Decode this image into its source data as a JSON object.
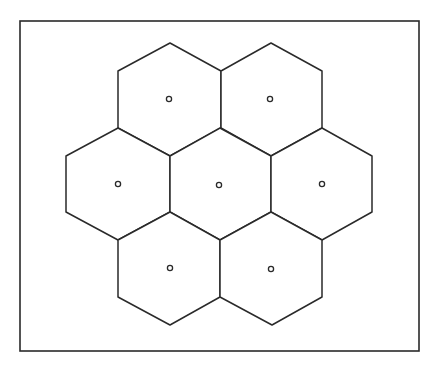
{
  "diagram": {
    "type": "hexagonal-tessellation",
    "colors": {
      "stroke": "#2a2a2a",
      "background": "#ffffff"
    },
    "frame": {
      "x": 20,
      "y": 21,
      "width": 399,
      "height": 330
    },
    "cells": [
      {
        "id": "top-left",
        "center": [
          169,
          99
        ],
        "points": [
          [
            170,
            43
          ],
          [
            221,
            71
          ],
          [
            221,
            128
          ],
          [
            170,
            156
          ],
          [
            118,
            128
          ],
          [
            118,
            71
          ]
        ]
      },
      {
        "id": "top-right",
        "center": [
          270,
          99
        ],
        "points": [
          [
            271,
            43
          ],
          [
            322,
            71
          ],
          [
            322,
            128
          ],
          [
            271,
            156
          ],
          [
            221,
            128
          ],
          [
            221,
            71
          ]
        ]
      },
      {
        "id": "middle-left",
        "center": [
          118,
          184
        ],
        "points": [
          [
            118,
            128
          ],
          [
            170,
            156
          ],
          [
            170,
            212
          ],
          [
            118,
            240
          ],
          [
            66,
            212
          ],
          [
            66,
            156
          ]
        ]
      },
      {
        "id": "middle-center",
        "center": [
          219,
          185
        ],
        "points": [
          [
            220,
            128
          ],
          [
            271,
            156
          ],
          [
            271,
            212
          ],
          [
            220,
            240
          ],
          [
            170,
            212
          ],
          [
            170,
            156
          ]
        ]
      },
      {
        "id": "middle-right",
        "center": [
          322,
          184
        ],
        "points": [
          [
            322,
            128
          ],
          [
            372,
            156
          ],
          [
            372,
            212
          ],
          [
            322,
            240
          ],
          [
            271,
            212
          ],
          [
            271,
            156
          ]
        ]
      },
      {
        "id": "bottom-left",
        "center": [
          170,
          268
        ],
        "points": [
          [
            170,
            212
          ],
          [
            220,
            240
          ],
          [
            220,
            297
          ],
          [
            170,
            325
          ],
          [
            118,
            297
          ],
          [
            118,
            240
          ]
        ]
      },
      {
        "id": "bottom-right",
        "center": [
          271,
          269
        ],
        "points": [
          [
            271,
            212
          ],
          [
            322,
            240
          ],
          [
            322,
            297
          ],
          [
            272,
            325
          ],
          [
            220,
            297
          ],
          [
            220,
            240
          ]
        ]
      }
    ],
    "site_marker": {
      "shape": "hollow-circle",
      "radius": 2.6
    }
  }
}
